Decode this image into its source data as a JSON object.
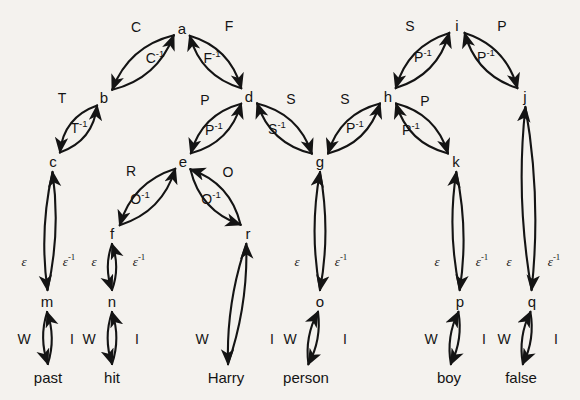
{
  "figure": {
    "type": "directed-graph",
    "background_color": "#f4f2ee",
    "ink_color": "#141414"
  },
  "nodes": [
    {
      "id": "a",
      "label": "a",
      "x": 182,
      "y": 28
    },
    {
      "id": "b",
      "label": "b",
      "x": 104,
      "y": 97
    },
    {
      "id": "c",
      "label": "c",
      "x": 53,
      "y": 161
    },
    {
      "id": "d",
      "label": "d",
      "x": 249,
      "y": 96
    },
    {
      "id": "e",
      "label": "e",
      "x": 183,
      "y": 161
    },
    {
      "id": "f",
      "label": "f",
      "x": 112,
      "y": 233
    },
    {
      "id": "g",
      "label": "g",
      "x": 320,
      "y": 161
    },
    {
      "id": "h",
      "label": "h",
      "x": 388,
      "y": 96
    },
    {
      "id": "i",
      "label": "i",
      "x": 457,
      "y": 25
    },
    {
      "id": "j",
      "label": "j",
      "x": 525,
      "y": 96
    },
    {
      "id": "k",
      "label": "k",
      "x": 456,
      "y": 161
    },
    {
      "id": "r",
      "label": "r",
      "x": 248,
      "y": 233
    },
    {
      "id": "m",
      "label": "m",
      "x": 47,
      "y": 301
    },
    {
      "id": "n",
      "label": "n",
      "x": 112,
      "y": 301
    },
    {
      "id": "o",
      "label": "o",
      "x": 320,
      "y": 301
    },
    {
      "id": "p",
      "label": "p",
      "x": 460,
      "y": 301
    },
    {
      "id": "q",
      "label": "q",
      "x": 532,
      "y": 301
    }
  ],
  "word_nodes": [
    {
      "id": "w_past",
      "label": "past",
      "x": 48,
      "y": 377
    },
    {
      "id": "w_hit",
      "label": "hit",
      "x": 112,
      "y": 377
    },
    {
      "id": "w_harry",
      "label": "Harry",
      "x": 226,
      "y": 377
    },
    {
      "id": "w_person",
      "label": "person",
      "x": 306,
      "y": 377
    },
    {
      "id": "w_boy",
      "label": "boy",
      "x": 449,
      "y": 377
    },
    {
      "id": "w_false",
      "label": "false",
      "x": 521,
      "y": 377
    }
  ],
  "edge_labels": [
    {
      "id": "lbl_C",
      "text": "C",
      "sup": "",
      "x": 136,
      "y": 27,
      "style": "plain"
    },
    {
      "id": "lbl_Cinv",
      "text": "C",
      "sup": "-1",
      "x": 155,
      "y": 58,
      "style": "plain"
    },
    {
      "id": "lbl_F",
      "text": "F",
      "sup": "",
      "x": 229,
      "y": 26,
      "style": "plain"
    },
    {
      "id": "lbl_Finv",
      "text": "F",
      "sup": "-1",
      "x": 212,
      "y": 58,
      "style": "plain"
    },
    {
      "id": "lbl_T",
      "text": "T",
      "sup": "",
      "x": 62,
      "y": 98,
      "style": "plain"
    },
    {
      "id": "lbl_Tinv",
      "text": "T",
      "sup": "-1",
      "x": 79,
      "y": 128,
      "style": "plain"
    },
    {
      "id": "lbl_P_de",
      "text": "P",
      "sup": "",
      "x": 205,
      "y": 100,
      "style": "plain"
    },
    {
      "id": "lbl_Pinv_ed",
      "text": "P",
      "sup": "-1",
      "x": 214,
      "y": 130,
      "style": "plain"
    },
    {
      "id": "lbl_S_dg",
      "text": "S",
      "sup": "",
      "x": 291,
      "y": 99,
      "style": "plain"
    },
    {
      "id": "lbl_Sinv_gd",
      "text": "S",
      "sup": "-1",
      "x": 277,
      "y": 129,
      "style": "plain"
    },
    {
      "id": "lbl_R",
      "text": "R",
      "sup": "",
      "x": 131,
      "y": 171,
      "style": "plain"
    },
    {
      "id": "lbl_Oinv_fe",
      "text": "O",
      "sup": "-1",
      "x": 140,
      "y": 199,
      "style": "plain"
    },
    {
      "id": "lbl_O_er",
      "text": "O",
      "sup": "",
      "x": 228,
      "y": 172,
      "style": "plain"
    },
    {
      "id": "lbl_Oinv_re",
      "text": "O",
      "sup": "-1",
      "x": 211,
      "y": 199,
      "style": "plain"
    },
    {
      "id": "lbl_S_gh",
      "text": "S",
      "sup": "",
      "x": 345,
      "y": 99,
      "style": "plain"
    },
    {
      "id": "lbl_Pinv_hg",
      "text": "P",
      "sup": "-1",
      "x": 355,
      "y": 128,
      "style": "plain"
    },
    {
      "id": "lbl_S_ih",
      "text": "S",
      "sup": "",
      "x": 410,
      "y": 26,
      "style": "plain"
    },
    {
      "id": "lbl_Pinv_hi",
      "text": "P",
      "sup": "-1",
      "x": 423,
      "y": 57,
      "style": "plain"
    },
    {
      "id": "lbl_P_ij",
      "text": "P",
      "sup": "",
      "x": 502,
      "y": 26,
      "style": "plain"
    },
    {
      "id": "lbl_Pinv_ji",
      "text": "P",
      "sup": "-1",
      "x": 486,
      "y": 57,
      "style": "plain"
    },
    {
      "id": "lbl_P_hk",
      "text": "P",
      "sup": "",
      "x": 425,
      "y": 101,
      "style": "plain"
    },
    {
      "id": "lbl_Pinv_kh",
      "text": "P",
      "sup": "-1",
      "x": 411,
      "y": 130,
      "style": "plain"
    },
    {
      "id": "lbl_eps_cm",
      "text": "ε",
      "sup": "",
      "x": 24,
      "y": 261,
      "style": "eps"
    },
    {
      "id": "lbl_epsi_mc",
      "text": "ε",
      "sup": "-1",
      "x": 69,
      "y": 261,
      "style": "eps"
    },
    {
      "id": "lbl_eps_fn",
      "text": "ε",
      "sup": "",
      "x": 94,
      "y": 261,
      "style": "eps"
    },
    {
      "id": "lbl_epsi_nf",
      "text": "ε",
      "sup": "-1",
      "x": 139,
      "y": 261,
      "style": "eps"
    },
    {
      "id": "lbl_eps_go",
      "text": "ε",
      "sup": "",
      "x": 297,
      "y": 261,
      "style": "eps"
    },
    {
      "id": "lbl_epsi_og",
      "text": "ε",
      "sup": "-1",
      "x": 341,
      "y": 261,
      "style": "eps"
    },
    {
      "id": "lbl_eps_kp",
      "text": "ε",
      "sup": "",
      "x": 437,
      "y": 261,
      "style": "eps"
    },
    {
      "id": "lbl_epsi_pk",
      "text": "ε",
      "sup": "-1",
      "x": 482,
      "y": 261,
      "style": "eps"
    },
    {
      "id": "lbl_eps_jq",
      "text": "ε",
      "sup": "",
      "x": 509,
      "y": 261,
      "style": "eps"
    },
    {
      "id": "lbl_epsi_qj",
      "text": "ε",
      "sup": "-1",
      "x": 554,
      "y": 261,
      "style": "eps"
    },
    {
      "id": "lbl_W_past",
      "text": "W",
      "sup": "",
      "x": 24,
      "y": 339,
      "style": "plain"
    },
    {
      "id": "lbl_I_past",
      "text": "I",
      "sup": "",
      "x": 72,
      "y": 339,
      "style": "plain"
    },
    {
      "id": "lbl_W_hit",
      "text": "W",
      "sup": "",
      "x": 89,
      "y": 339,
      "style": "plain"
    },
    {
      "id": "lbl_I_hit",
      "text": "I",
      "sup": "",
      "x": 137,
      "y": 339,
      "style": "plain"
    },
    {
      "id": "lbl_W_harry",
      "text": "W",
      "sup": "",
      "x": 202,
      "y": 339,
      "style": "plain"
    },
    {
      "id": "lbl_I_harry",
      "text": "I",
      "sup": "",
      "x": 272,
      "y": 339,
      "style": "plain"
    },
    {
      "id": "lbl_W_person",
      "text": "W",
      "sup": "",
      "x": 290,
      "y": 339,
      "style": "plain"
    },
    {
      "id": "lbl_I_person",
      "text": "I",
      "sup": "",
      "x": 345,
      "y": 339,
      "style": "plain"
    },
    {
      "id": "lbl_W_boy",
      "text": "W",
      "sup": "",
      "x": 431,
      "y": 339,
      "style": "plain"
    },
    {
      "id": "lbl_I_boy",
      "text": "I",
      "sup": "",
      "x": 484,
      "y": 339,
      "style": "plain"
    },
    {
      "id": "lbl_W_false",
      "text": "W",
      "sup": "",
      "x": 504,
      "y": 339,
      "style": "plain"
    },
    {
      "id": "lbl_I_false",
      "text": "I",
      "sup": "",
      "x": 556,
      "y": 339,
      "style": "plain"
    }
  ],
  "edges": [
    {
      "from": "a",
      "to": "b",
      "label": "C",
      "bow": "outer"
    },
    {
      "from": "b",
      "to": "a",
      "label": "C^-1",
      "bow": "inner"
    },
    {
      "from": "a",
      "to": "d",
      "label": "F",
      "bow": "outer"
    },
    {
      "from": "d",
      "to": "a",
      "label": "F^-1",
      "bow": "inner"
    },
    {
      "from": "b",
      "to": "c",
      "label": "T",
      "bow": "outer"
    },
    {
      "from": "c",
      "to": "b",
      "label": "T^-1",
      "bow": "inner"
    },
    {
      "from": "d",
      "to": "e",
      "label": "P",
      "bow": "outer"
    },
    {
      "from": "e",
      "to": "d",
      "label": "P^-1",
      "bow": "inner"
    },
    {
      "from": "d",
      "to": "g",
      "label": "S",
      "bow": "outer"
    },
    {
      "from": "g",
      "to": "d",
      "label": "S^-1",
      "bow": "inner"
    },
    {
      "from": "e",
      "to": "f",
      "label": "R",
      "bow": "outer"
    },
    {
      "from": "f",
      "to": "e",
      "label": "O^-1",
      "bow": "inner"
    },
    {
      "from": "e",
      "to": "r",
      "label": "O",
      "bow": "outer"
    },
    {
      "from": "r",
      "to": "e",
      "label": "O^-1",
      "bow": "inner"
    },
    {
      "from": "h",
      "to": "g",
      "label": "S",
      "bow": "outer"
    },
    {
      "from": "g",
      "to": "h",
      "label": "P^-1",
      "bow": "inner"
    },
    {
      "from": "i",
      "to": "h",
      "label": "S",
      "bow": "outer"
    },
    {
      "from": "h",
      "to": "i",
      "label": "P^-1",
      "bow": "inner"
    },
    {
      "from": "i",
      "to": "j",
      "label": "P",
      "bow": "outer"
    },
    {
      "from": "j",
      "to": "i",
      "label": "P^-1",
      "bow": "inner"
    },
    {
      "from": "h",
      "to": "k",
      "label": "P",
      "bow": "outer"
    },
    {
      "from": "k",
      "to": "h",
      "label": "P^-1",
      "bow": "inner"
    },
    {
      "from": "c",
      "to": "m",
      "label": "ε",
      "bow": "outer"
    },
    {
      "from": "m",
      "to": "c",
      "label": "ε^-1",
      "bow": "inner"
    },
    {
      "from": "f",
      "to": "n",
      "label": "ε",
      "bow": "outer"
    },
    {
      "from": "n",
      "to": "f",
      "label": "ε^-1",
      "bow": "inner"
    },
    {
      "from": "g",
      "to": "o",
      "label": "ε",
      "bow": "outer"
    },
    {
      "from": "o",
      "to": "g",
      "label": "ε^-1",
      "bow": "inner"
    },
    {
      "from": "k",
      "to": "p",
      "label": "ε",
      "bow": "outer"
    },
    {
      "from": "p",
      "to": "k",
      "label": "ε^-1",
      "bow": "inner"
    },
    {
      "from": "j",
      "to": "q",
      "label": "ε",
      "bow": "outer"
    },
    {
      "from": "q",
      "to": "j",
      "label": "ε^-1",
      "bow": "inner"
    },
    {
      "from": "m",
      "to": "w_past",
      "label": "W",
      "bow": "outer"
    },
    {
      "from": "w_past",
      "to": "m",
      "label": "I",
      "bow": "inner"
    },
    {
      "from": "n",
      "to": "w_hit",
      "label": "W",
      "bow": "outer"
    },
    {
      "from": "w_hit",
      "to": "n",
      "label": "I",
      "bow": "inner"
    },
    {
      "from": "r",
      "to": "w_harry",
      "label": "W",
      "bow": "outer"
    },
    {
      "from": "w_harry",
      "to": "r",
      "label": "I",
      "bow": "inner"
    },
    {
      "from": "o",
      "to": "w_person",
      "label": "W",
      "bow": "outer"
    },
    {
      "from": "w_person",
      "to": "o",
      "label": "I",
      "bow": "inner"
    },
    {
      "from": "p",
      "to": "w_boy",
      "label": "W",
      "bow": "outer"
    },
    {
      "from": "w_boy",
      "to": "p",
      "label": "I",
      "bow": "inner"
    },
    {
      "from": "q",
      "to": "w_false",
      "label": "W",
      "bow": "outer"
    },
    {
      "from": "w_false",
      "to": "q",
      "label": "I",
      "bow": "inner"
    }
  ]
}
